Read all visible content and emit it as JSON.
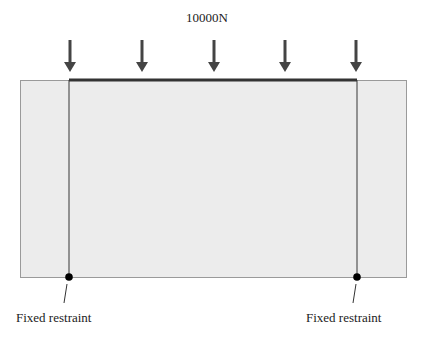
{
  "diagram": {
    "load_label": "10000N",
    "support_labels": [
      "Fixed restraint",
      "Fixed restraint"
    ],
    "arrow_count": 5,
    "colors": {
      "outer_fill": "#ececec",
      "outer_stroke": "#9a9a9a",
      "inner_stroke": "#555555",
      "top_edge": "#333333",
      "arrow": "#444444",
      "support_dot": "#000000"
    }
  }
}
